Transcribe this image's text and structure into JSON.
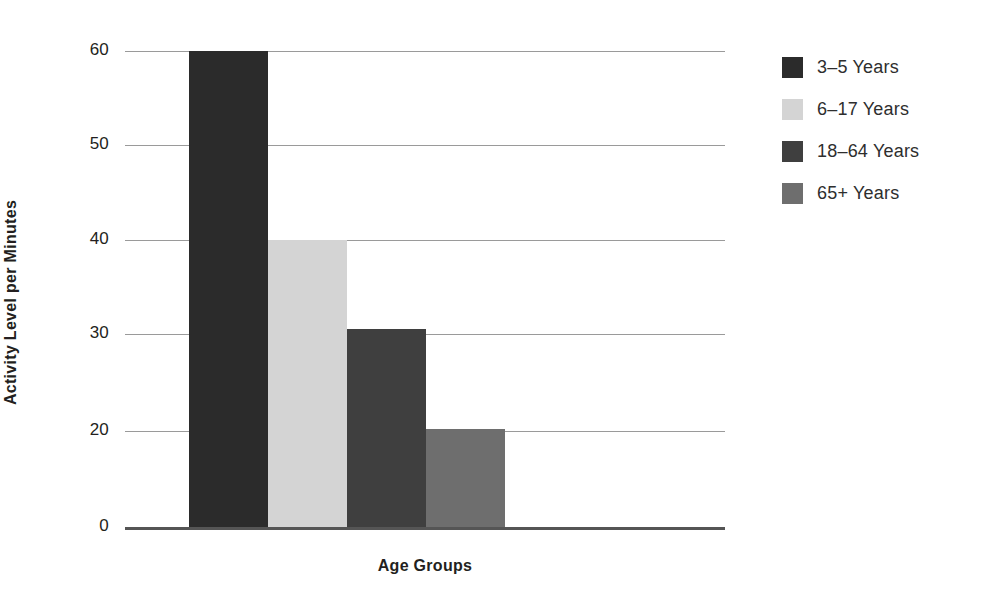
{
  "chart_data": {
    "type": "bar",
    "title": "",
    "xlabel": "Age Groups",
    "ylabel": "Activity Level per Minutes",
    "categories": [
      "3–5 Years",
      "6–17 Years",
      "18–64 Years",
      "65+ Years"
    ],
    "values": [
      60,
      40,
      30.5,
      20.2
    ],
    "series": [
      {
        "name": "Activity Level per Minutes",
        "values": [
          60,
          40,
          30.5,
          20.2
        ]
      }
    ],
    "bars": [
      {
        "category": "3–5 Years",
        "value": 60,
        "color": "#2b2b2b"
      },
      {
        "category": "6–17 Years",
        "value": 40,
        "color": "#d4d4d4"
      },
      {
        "category": "18–64 Years",
        "value": 30.5,
        "color": "#3f3f3f"
      },
      {
        "category": "65+ Years",
        "value": 20.2,
        "color": "#6e6e6e"
      }
    ],
    "ylim": [
      0,
      60
    ],
    "yticks": [
      0,
      20,
      30,
      40,
      50,
      60
    ],
    "ytick_labels": [
      "0",
      "20",
      "30",
      "40",
      "50",
      "60"
    ],
    "ytick_pixel_y": [
      527,
      431,
      334,
      240,
      145,
      51
    ],
    "xticks": [],
    "xtick_labels": [],
    "grid": true,
    "grid_axis": "y",
    "grid_color": "#9a9a9a",
    "axis_color": "#555555",
    "background": "#ffffff",
    "legend": {
      "position": "right",
      "entries": [
        {
          "label": "3–5 Years",
          "color": "#2b2b2b"
        },
        {
          "label": "6–17 Years",
          "color": "#d4d4d4"
        },
        {
          "label": "18–64 Years",
          "color": "#3f3f3f"
        },
        {
          "label": "65+ Years",
          "color": "#6e6e6e"
        }
      ]
    }
  }
}
